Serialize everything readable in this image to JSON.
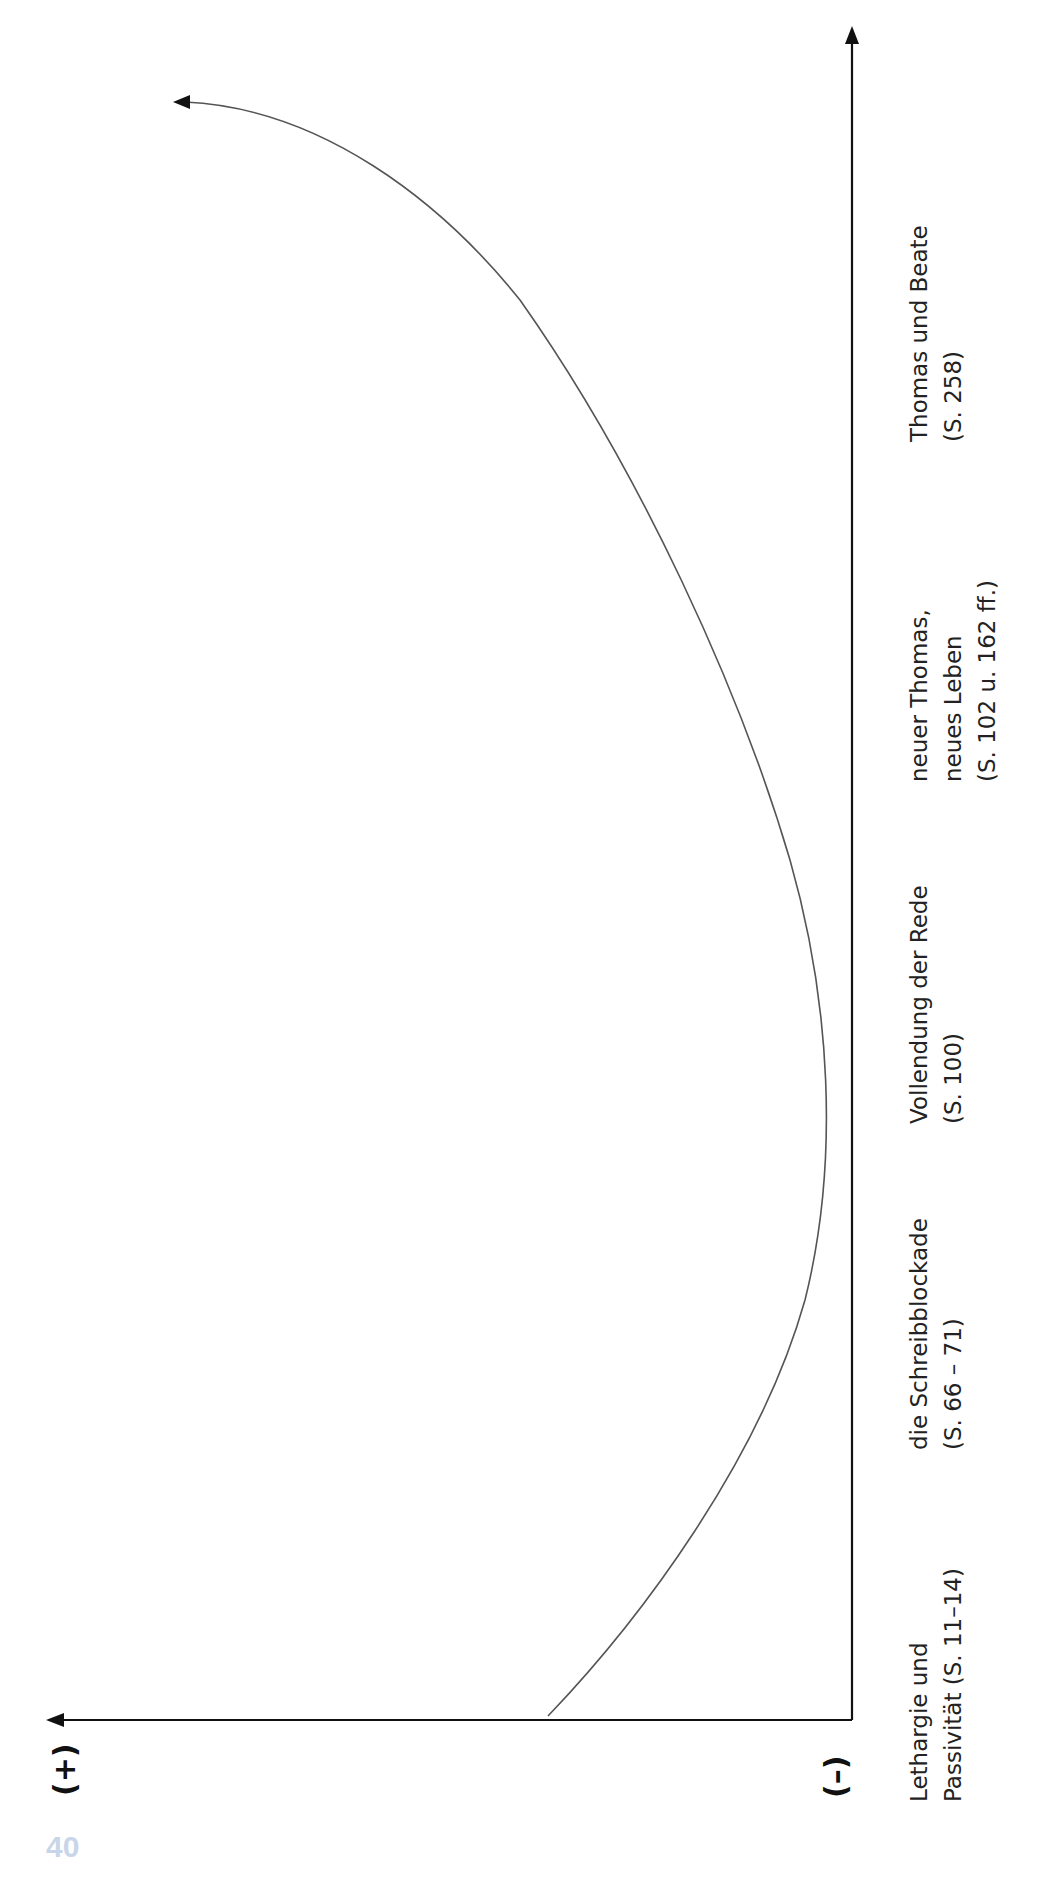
{
  "page": {
    "page_number": "40"
  },
  "axes": {
    "positive_label": "(+)",
    "negative_label": "(–)"
  },
  "stages": [
    {
      "lines": [
        "Lethargie und",
        "Passivität (S. 11–14)"
      ]
    },
    {
      "lines": [
        "die Schreibblockade",
        "(S. 66 – 71)"
      ]
    },
    {
      "lines": [
        "Vollendung der Rede",
        "(S. 100)"
      ]
    },
    {
      "lines": [
        "neuer Thomas,",
        "neues Leben",
        "(S. 102 u. 162 ff.)"
      ]
    },
    {
      "lines": [
        "Thomas und Beate",
        "(S. 258)"
      ]
    }
  ],
  "colors": {
    "axis": "#111111",
    "curve": "#555555",
    "page_number": "#c9d5e8"
  },
  "curve": {
    "description": "Development curve: starts low near the negative pole at 'Lethargie und Passivität', dips lowest around 'Vollendung der Rede', then rises steeply toward the positive pole after 'Thomas und Beate'",
    "points": [
      [
        548,
        1716
      ],
      [
        620,
        1650
      ],
      [
        747,
        1450
      ],
      [
        813,
        1250
      ],
      [
        826,
        1060
      ],
      [
        681,
        550
      ],
      [
        590,
        380
      ],
      [
        520,
        290
      ],
      [
        380,
        173
      ],
      [
        173,
        102
      ]
    ]
  }
}
